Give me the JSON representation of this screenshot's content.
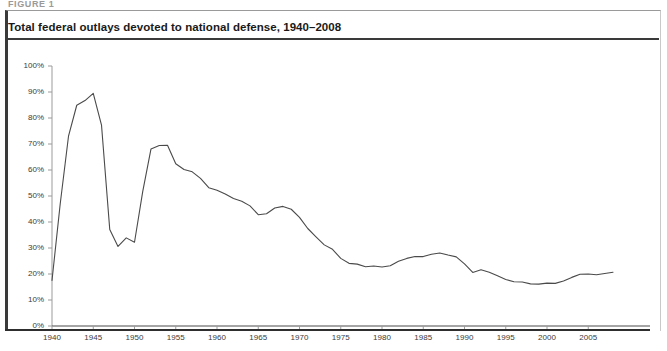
{
  "figure": {
    "cut_label": "FIGURE 1",
    "title": "Total federal outlays devoted to national defense, 1940–2008",
    "footnote": ""
  },
  "chart_data": {
    "type": "line",
    "title": "Total federal outlays devoted to national defense, 1940–2008",
    "xlabel": "",
    "ylabel": "",
    "xlim": [
      1940,
      2008
    ],
    "ylim": [
      0,
      100
    ],
    "grid": false,
    "legend": null,
    "y_tick_labels": [
      "0%",
      "10%",
      "20%",
      "30%",
      "40%",
      "50%",
      "60%",
      "70%",
      "80%",
      "90%",
      "100%"
    ],
    "y_ticks": [
      0,
      10,
      20,
      30,
      40,
      50,
      60,
      70,
      80,
      90,
      100
    ],
    "x_tick_labels": [
      "1940",
      "1945",
      "1950",
      "1955",
      "1960",
      "1965",
      "1970",
      "1975",
      "1980",
      "1985",
      "1990",
      "1995",
      "2000",
      "2005"
    ],
    "x_ticks": [
      1940,
      1945,
      1950,
      1955,
      1960,
      1965,
      1970,
      1975,
      1980,
      1985,
      1990,
      1995,
      2000,
      2005
    ],
    "line_color": "#4a4a4a",
    "x": [
      1940,
      1941,
      1942,
      1943,
      1944,
      1945,
      1946,
      1947,
      1948,
      1949,
      1950,
      1951,
      1952,
      1953,
      1954,
      1955,
      1956,
      1957,
      1958,
      1959,
      1960,
      1961,
      1962,
      1963,
      1964,
      1965,
      1966,
      1967,
      1968,
      1969,
      1970,
      1971,
      1972,
      1973,
      1974,
      1975,
      1976,
      1977,
      1978,
      1979,
      1980,
      1981,
      1982,
      1983,
      1984,
      1985,
      1986,
      1987,
      1988,
      1989,
      1990,
      1991,
      1992,
      1993,
      1994,
      1995,
      1996,
      1997,
      1998,
      1999,
      2000,
      2001,
      2002,
      2003,
      2004,
      2005,
      2006,
      2007,
      2008
    ],
    "y": [
      17.5,
      47.1,
      73.0,
      84.9,
      86.7,
      89.5,
      77.3,
      37.1,
      30.6,
      33.9,
      32.2,
      51.8,
      68.1,
      69.4,
      69.5,
      62.4,
      60.2,
      59.3,
      56.8,
      53.2,
      52.2,
      50.8,
      49.0,
      48.0,
      46.2,
      42.8,
      43.2,
      45.4,
      46.0,
      44.9,
      41.8,
      37.5,
      34.3,
      31.2,
      29.5,
      26.0,
      24.1,
      23.8,
      22.8,
      23.1,
      22.7,
      23.2,
      24.9,
      26.0,
      26.7,
      26.7,
      27.6,
      28.1,
      27.3,
      26.6,
      23.9,
      20.6,
      21.6,
      20.7,
      19.3,
      17.9,
      17.0,
      16.9,
      16.2,
      16.1,
      16.5,
      16.4,
      17.3,
      18.7,
      19.9,
      20.0,
      19.7,
      20.2,
      20.7
    ]
  }
}
